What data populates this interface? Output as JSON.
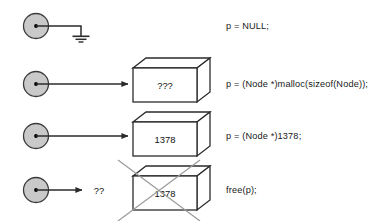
{
  "figure": {
    "background": "#ffffff",
    "stroke": "#2b2b2b",
    "node_fill": "#c9c9c9",
    "box_face_fill": "#ffffff",
    "cross_out_color": "#9a9a9a"
  },
  "rows": [
    {
      "id": "row-null",
      "node_icon": "pointer-node-circle",
      "connector": "line-to-ground",
      "terminal_icon": "ground-symbol",
      "box": null,
      "box_value": null,
      "annotation": null,
      "code": "p = NULL;"
    },
    {
      "id": "row-malloc",
      "node_icon": "pointer-node-circle",
      "connector": "arrow-right",
      "terminal_icon": "memory-box",
      "box": "memory-box-unknown",
      "box_value": "???",
      "annotation": null,
      "code": "p = (Node *)malloc(sizeof(Node));"
    },
    {
      "id": "row-address",
      "node_icon": "pointer-node-circle",
      "connector": "arrow-right",
      "terminal_icon": "memory-box",
      "box": "memory-box-address",
      "box_value": "1378",
      "annotation": null,
      "code": "p = (Node *)1378;"
    },
    {
      "id": "row-free",
      "node_icon": "pointer-node-circle",
      "connector": "arrow-right-short",
      "terminal_icon": "memory-box-crossed-out",
      "box": "memory-box-freed",
      "box_value": "1378",
      "annotation": "??",
      "code": "free(p);"
    }
  ],
  "labels": {
    "dangling_marker": "??",
    "unknown_marker": "???",
    "address_value": "1378"
  }
}
